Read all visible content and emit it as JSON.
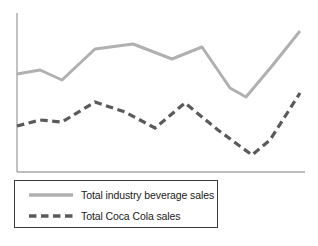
{
  "chart_data": {
    "type": "line",
    "title": "",
    "subtitle": "",
    "xlabel": "",
    "ylabel": "",
    "grid": false,
    "axes": {
      "x_axis_visible": true,
      "y_axis_visible": true,
      "x_tick_labels": [],
      "y_tick_labels": [],
      "xlim": [
        0,
        10
      ],
      "ylim": [
        0,
        100
      ]
    },
    "x": [
      0,
      1,
      2,
      3,
      4,
      5,
      6,
      7,
      8,
      9,
      10
    ],
    "legend": {
      "position": "below-plot",
      "entries": [
        {
          "name": "Total industry beverage sales",
          "color": "#b0b0b0",
          "style": "solid",
          "icon": "solid-line-swatch"
        },
        {
          "name": "Total Coca Cola sales",
          "color": "#5a5a5a",
          "style": "dashed",
          "icon": "dashed-line-swatch"
        }
      ]
    },
    "series": [
      {
        "name": "Total industry beverage sales",
        "color": "#b0b0b0",
        "style": "solid",
        "values": [
          59,
          62,
          54,
          76,
          80,
          69,
          76,
          50,
          44,
          62,
          88
        ],
        "points": [
          [
            17,
            74
          ],
          [
            40,
            70
          ],
          [
            62,
            80
          ],
          [
            95,
            49
          ],
          [
            133,
            44
          ],
          [
            172,
            59
          ],
          [
            202,
            47
          ],
          [
            230,
            88
          ],
          [
            246,
            97
          ],
          [
            272,
            66
          ],
          [
            300,
            31
          ]
        ]
      },
      {
        "name": "Total Coca Cola sales",
        "color": "#5a5a5a",
        "style": "dashed",
        "values": [
          29,
          33,
          32,
          45,
          38,
          32,
          45,
          30,
          20,
          26,
          53
        ],
        "points": [
          [
            17,
            126
          ],
          [
            40,
            120
          ],
          [
            62,
            122
          ],
          [
            95,
            102
          ],
          [
            125,
            112
          ],
          [
            155,
            128
          ],
          [
            185,
            103
          ],
          [
            218,
            130
          ],
          [
            252,
            155
          ],
          [
            270,
            140
          ],
          [
            300,
            93
          ]
        ]
      }
    ]
  },
  "legend_entries": {
    "series_1_label": "Total industry beverage sales",
    "series_2_label": "Total Coca Cola sales"
  },
  "colors": {
    "series_1": "#b0b0b0",
    "series_2": "#5a5a5a",
    "axis": "#a8a8a8",
    "axis_baseline": "#7d7d7d",
    "legend_border": "#3a3a3a",
    "text": "#1a1a1a",
    "background": "#ffffff"
  }
}
